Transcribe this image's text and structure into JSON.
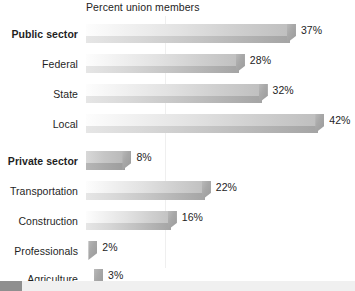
{
  "chart": {
    "title": "Percent union members",
    "axis_max": 46,
    "gridline_value": 14
  },
  "chart_data": {
    "type": "bar",
    "title": "Percent union members",
    "xlabel": "",
    "ylabel": "",
    "orientation": "horizontal",
    "unit": "%",
    "xlim": [
      0,
      46
    ],
    "grid": true,
    "legend": "none",
    "categories": [
      "Public sector",
      "Federal",
      "State",
      "Local",
      "Private sector",
      "Transportation",
      "Construction",
      "Professionals",
      "Agriculture"
    ],
    "values": [
      37,
      28,
      32,
      42,
      8,
      22,
      16,
      2,
      3
    ],
    "labels": [
      "37%",
      "28%",
      "32%",
      "42%",
      "8%",
      "22%",
      "16%",
      "2%",
      "3%"
    ],
    "groups": [
      {
        "name": "Public sector",
        "value": 37,
        "label": "37%",
        "bold": true,
        "members": [
          {
            "name": "Federal",
            "value": 28,
            "label": "28%"
          },
          {
            "name": "State",
            "value": 32,
            "label": "32%"
          },
          {
            "name": "Local",
            "value": 42,
            "label": "42%"
          }
        ]
      },
      {
        "name": "Private sector",
        "value": 8,
        "label": "8%",
        "bold": true,
        "members": [
          {
            "name": "Transportation",
            "value": 22,
            "label": "22%"
          },
          {
            "name": "Construction",
            "value": 16,
            "label": "16%"
          },
          {
            "name": "Professionals",
            "value": 2,
            "label": "2%"
          },
          {
            "name": "Agriculture",
            "value": 3,
            "label": "3%"
          }
        ]
      }
    ]
  },
  "rows": [
    {
      "label": "Public sector",
      "value": 37,
      "value_label": "37%",
      "bold": true,
      "top": 6
    },
    {
      "label": "Federal",
      "value": 28,
      "value_label": "28%",
      "bold": false,
      "top": 36
    },
    {
      "label": "State",
      "value": 32,
      "value_label": "32%",
      "bold": false,
      "top": 66
    },
    {
      "label": "Local",
      "value": 42,
      "value_label": "42%",
      "bold": false,
      "top": 96
    },
    {
      "label": "Private sector",
      "value": 8,
      "value_label": "8%",
      "bold": true,
      "top": 133
    },
    {
      "label": "Transportation",
      "value": 22,
      "value_label": "22%",
      "bold": false,
      "top": 163
    },
    {
      "label": "Construction",
      "value": 16,
      "value_label": "16%",
      "bold": false,
      "top": 193
    },
    {
      "label": "Professionals",
      "value": 2,
      "value_label": "2%",
      "bold": false,
      "top": 223
    },
    {
      "label": "Agriculture",
      "value": 3,
      "value_label": "3%",
      "bold": false,
      "top": 251
    }
  ],
  "colors": {
    "bar_light": "#fdfdfd",
    "bar_dark": "#a4a4a4",
    "bevel": "#a8a8a8",
    "text": "#242424",
    "gridline": "#efefef",
    "footer_swatch": "#8f8f8f",
    "footer_bar": "#f0f0f0"
  }
}
